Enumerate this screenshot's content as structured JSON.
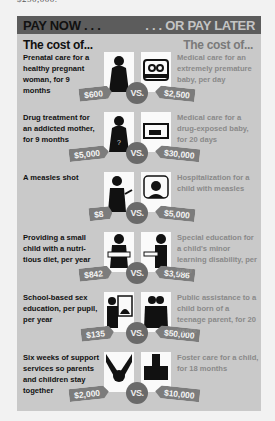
{
  "top_partial_text": "$250,000.",
  "header": {
    "left": "PAY NOW . . .",
    "right": ". . . OR PAY LATER"
  },
  "subhead": {
    "left": "The cost of...",
    "right": "The cost of..."
  },
  "vs_label": "VS.",
  "colors": {
    "panel_bg": "#c9c9c9",
    "header_bg": "#5c5c5c",
    "tag_bg": "#7c7c7c",
    "vs_bg": "#6a6a6a",
    "right_text": "#8a8a8a"
  },
  "rows": [
    {
      "now_text": "Prenatal care for a healthy pregnant woman, for 9 months",
      "now_price": "$600",
      "now_icon": "pregnant-woman-icon",
      "later_text": "Medical care for an extremely premature baby, per day",
      "later_price": "$2,500",
      "later_icon": "incubator-baby-icon"
    },
    {
      "now_text": "Drug treatment for an addicted mother, for 9 months",
      "now_price": "$5,000",
      "now_icon": "pregnant-woman-pills-icon",
      "later_text": "Medical care for a drug-exposed baby, for 20 days",
      "later_price": "$30,000",
      "later_icon": "baby-crib-icon"
    },
    {
      "now_text": "A measles shot",
      "now_price": "$8",
      "now_icon": "child-vaccine-icon",
      "later_text": "Hospitalization for a child with measles",
      "later_price": "$5,000",
      "later_icon": "hospital-bed-child-icon"
    },
    {
      "now_text": "Providing a small child with a nutri-tious diet, per year",
      "now_price": "$842",
      "now_icon": "child-meal-icon",
      "later_text": "Special education for a child's minor learning disability, per year",
      "later_price": "$3,986",
      "later_icon": "child-desk-icon"
    },
    {
      "now_text": "School-based sex education, per pupil, per year",
      "now_price": "$135",
      "now_icon": "teacher-board-icon",
      "later_text": "Public assistance to a child born of a teenage parent, for 20 years",
      "later_price": "$50,000",
      "later_icon": "teen-parent-family-icon"
    },
    {
      "now_text": "Six weeks of support services so parents and children stay together",
      "now_price": "$2,000",
      "now_icon": "holding-hands-icon",
      "later_text": "Foster care for a child, for 18 months",
      "later_price": "$10,000",
      "later_icon": "foster-child-icon"
    }
  ]
}
